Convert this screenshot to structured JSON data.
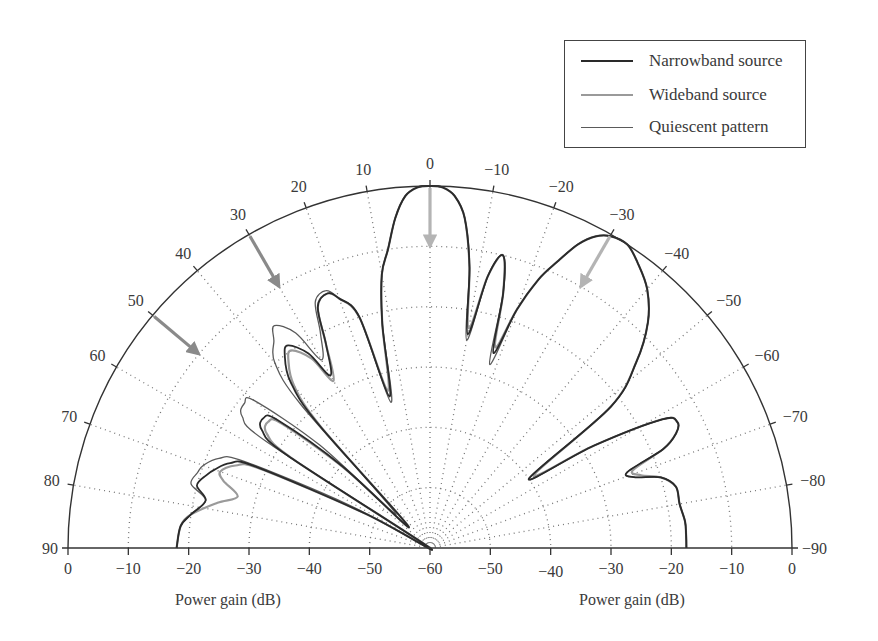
{
  "chart_data": {
    "type": "polar-line",
    "title": "",
    "angle_unit": "degrees",
    "radial_label": "Power gain (dB)",
    "radial_range_db": [
      -60,
      0
    ],
    "angle_range_deg": [
      -90,
      90
    ],
    "angular_ticks": [
      90,
      80,
      70,
      60,
      50,
      40,
      30,
      20,
      10,
      0,
      -10,
      -20,
      -30,
      -40,
      -50,
      -60,
      -70,
      -80,
      -90
    ],
    "angular_tick_labels": [
      "90",
      "80",
      "70",
      "60",
      "50",
      "40",
      "30",
      "20",
      "10",
      "0",
      "−10",
      "−20",
      "−30",
      "−40",
      "−50",
      "−60",
      "−70",
      "−80",
      "−90"
    ],
    "radial_ticks_left": [
      "0",
      "−10",
      "−20",
      "−30",
      "−40",
      "−50",
      "−60"
    ],
    "radial_ticks_right": [
      "−50",
      "−40",
      "−30",
      "−20",
      "−10",
      "0"
    ],
    "xlabel_left": "Power gain (dB)",
    "xlabel_right": "Power gain (dB)",
    "grid": "dotted, rings every 10 dB, spokes every 10°",
    "legend": {
      "position": "top-right",
      "entries": [
        {
          "name": "Narrowband source",
          "color": "#2a2a2a",
          "width": 2.2
        },
        {
          "name": "Wideband source",
          "color": "#9a9a9a",
          "width": 2.2
        },
        {
          "name": "Quiescent pattern",
          "color": "#5a5a5a",
          "width": 1.3
        }
      ]
    },
    "annotations": [
      {
        "type": "arrow",
        "angle_deg": 0,
        "color": "#b4b4b4",
        "meaning": "desired signal direction"
      },
      {
        "type": "arrow",
        "angle_deg": -30,
        "color": "#b4b4b4",
        "meaning": "source direction"
      },
      {
        "type": "arrow",
        "angle_deg": 30,
        "color": "#8a8a8a",
        "meaning": "interference direction"
      },
      {
        "type": "arrow",
        "angle_deg": 50,
        "color": "#8a8a8a",
        "meaning": "interference direction"
      }
    ],
    "series": [
      {
        "name": "Quiescent pattern",
        "angles_deg": [
          90,
          85,
          82,
          78,
          75,
          72,
          70,
          67,
          65,
          62,
          60,
          57,
          55,
          52,
          50,
          47,
          45,
          42,
          40,
          37,
          35,
          32,
          30,
          27,
          25,
          22,
          20,
          17,
          15,
          12,
          10,
          8,
          6,
          4,
          2,
          0,
          -2,
          -4,
          -6,
          -8,
          -10,
          -12,
          -14,
          -16,
          -18,
          -20,
          -22,
          -24,
          -26,
          -28,
          -30,
          -33,
          -36,
          -40,
          -44,
          -48,
          -52,
          -55,
          -58,
          -61,
          -63,
          -65,
          -67,
          -69,
          -71,
          -73,
          -76,
          -80,
          -84,
          -87,
          -90
        ],
        "gain_db": [
          -18,
          -18.5,
          -20,
          -22,
          -19,
          -19.5,
          -20,
          -22,
          -26,
          -45,
          -60,
          -28,
          -22,
          -21,
          -22,
          -35,
          -52,
          -28,
          -20,
          -17,
          -15,
          -18,
          -24,
          -20,
          -15,
          -14,
          -16,
          -20,
          -35,
          -22,
          -14,
          -10,
          -5,
          -1.5,
          -0.2,
          0,
          -0.2,
          -1.5,
          -5,
          -13,
          -25,
          -14,
          -10,
          -16,
          -28,
          -18,
          -12,
          -8,
          -4,
          -1.5,
          -0.3,
          0,
          -1.5,
          -4,
          -8,
          -14,
          -22,
          -40,
          -28,
          -16,
          -14,
          -15,
          -18,
          -25,
          -24,
          -20,
          -18,
          -18,
          -17.5,
          -17.5,
          -17.5
        ]
      },
      {
        "name": "Narrowband source",
        "angles_deg": [
          90,
          85,
          82,
          78,
          75,
          72,
          70,
          67,
          65,
          62,
          60,
          57,
          55,
          52,
          50,
          47,
          45,
          42,
          40,
          37,
          35,
          32,
          30,
          27,
          25,
          22,
          20,
          17,
          15,
          12,
          10,
          8,
          6,
          4,
          2,
          0,
          -2,
          -4,
          -6,
          -8,
          -10,
          -12,
          -14,
          -16,
          -18,
          -20,
          -22,
          -24,
          -26,
          -28,
          -30,
          -33,
          -36,
          -40,
          -44,
          -48,
          -52,
          -55,
          -58,
          -61,
          -63,
          -65,
          -67,
          -69,
          -71,
          -73,
          -76,
          -80,
          -84,
          -87,
          -90
        ],
        "gain_db": [
          -18,
          -18.5,
          -20,
          -22,
          -20,
          -21,
          -22,
          -24,
          -28,
          -48,
          -60,
          -32,
          -26,
          -25,
          -27,
          -40,
          -55,
          -32,
          -24,
          -20,
          -19,
          -22,
          -27,
          -22,
          -16,
          -14.5,
          -16,
          -20,
          -34,
          -22,
          -14,
          -10,
          -5,
          -1.5,
          -0.2,
          0,
          -0.2,
          -1.5,
          -5,
          -13,
          -24,
          -14,
          -10,
          -16,
          -26,
          -18,
          -12,
          -8,
          -4,
          -1.5,
          -0.3,
          0,
          -1.5,
          -4,
          -8,
          -14,
          -22,
          -40,
          -28,
          -16,
          -14,
          -15,
          -18,
          -25,
          -24,
          -20,
          -18,
          -18,
          -17.5,
          -17.5,
          -17.5
        ]
      },
      {
        "name": "Wideband source",
        "angles_deg": [
          90,
          85,
          82,
          78,
          75,
          72,
          70,
          67,
          65,
          62,
          60,
          57,
          55,
          52,
          50,
          47,
          45,
          42,
          40,
          37,
          35,
          32,
          30,
          27,
          25,
          22,
          20,
          17,
          15,
          12,
          10,
          8,
          6,
          4,
          2,
          0,
          -2,
          -4,
          -6,
          -8,
          -10,
          -12,
          -14,
          -16,
          -18,
          -20,
          -22,
          -24,
          -26,
          -28,
          -30,
          -33,
          -36,
          -40,
          -44,
          -48,
          -52,
          -55,
          -58,
          -61,
          -63,
          -65,
          -67,
          -69,
          -71,
          -73,
          -76,
          -80,
          -84,
          -87,
          -90
        ],
        "gain_db": [
          -18,
          -18.5,
          -20,
          -24,
          -27,
          -24,
          -23,
          -25,
          -29,
          -48,
          -60,
          -33,
          -27,
          -26,
          -28,
          -41,
          -55,
          -33,
          -25,
          -21,
          -20,
          -23,
          -28,
          -22,
          -16,
          -14.5,
          -16,
          -20,
          -33,
          -22,
          -14,
          -10,
          -5,
          -1.5,
          -0.2,
          0,
          -0.2,
          -1.5,
          -5,
          -13,
          -23,
          -14,
          -10,
          -16,
          -25,
          -18,
          -12,
          -8,
          -4,
          -1.5,
          -0.3,
          0,
          -1.5,
          -4,
          -8,
          -14,
          -22,
          -39,
          -28,
          -16,
          -14,
          -15,
          -18,
          -24,
          -23,
          -20,
          -18,
          -18,
          -17.5,
          -17.5,
          -17.5
        ]
      }
    ]
  }
}
